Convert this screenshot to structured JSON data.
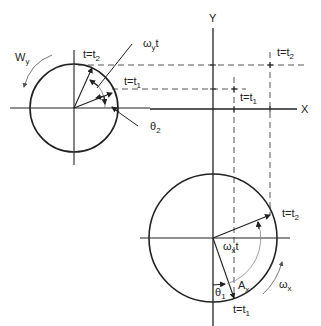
{
  "diagram": {
    "axes": {
      "x_label": "X",
      "y_label": "Y"
    },
    "top_left_circle": {
      "rotation_label": "W",
      "rotation_sub": "y",
      "angle_label": "ω",
      "angle_sub": "y",
      "angle_suffix": "t",
      "phase_label": "θ",
      "phase_sub": "2",
      "t2_label": "t=t",
      "t2_sub": "2",
      "t1_label": "t=t",
      "t1_sub": "1"
    },
    "right_labels": {
      "t2_label": "t=t",
      "t2_sub": "2",
      "t1_label": "t=t",
      "t1_sub": "1"
    },
    "bottom_circle": {
      "angle_label": "ω",
      "angle_sub": "x",
      "angle_suffix": "t",
      "amplitude_label": "A",
      "amplitude_sub": "x",
      "phase_label": "θ",
      "phase_sub": "1",
      "rotation_label": "ω",
      "rotation_sub": "x",
      "t2_label": "t=t",
      "t2_sub": "2",
      "t1_label": "t=t",
      "t1_sub": "1"
    },
    "colors": {
      "line": "#222222",
      "dash": "#444444",
      "arc": "#888888"
    }
  }
}
